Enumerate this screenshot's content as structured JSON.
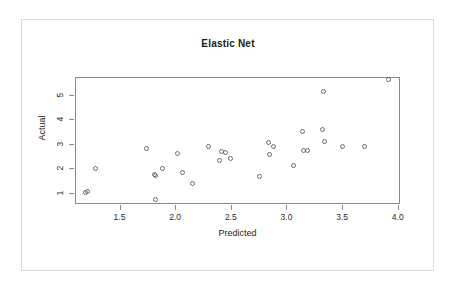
{
  "chart_data": {
    "type": "scatter",
    "title": "Elastic Net",
    "xlabel": "Predicted",
    "ylabel": "Actual",
    "xlim": [
      1.1,
      4.02
    ],
    "ylim": [
      0.55,
      5.72
    ],
    "xticks": [
      "1.5",
      "2.0",
      "2.5",
      "3.0",
      "3.5",
      "4.0"
    ],
    "xtick_values": [
      1.5,
      2.0,
      2.5,
      3.0,
      3.5,
      4.0
    ],
    "yticks": [
      "1",
      "2",
      "3",
      "4",
      "5"
    ],
    "ytick_values": [
      1,
      2,
      3,
      4,
      5
    ],
    "grid": false,
    "legend": "none",
    "marker": "open-circle",
    "marker_color": "#6b6b6b",
    "series": [
      {
        "name": "Predicted vs Actual",
        "points": [
          [
            1.19,
            1.03
          ],
          [
            1.21,
            1.05
          ],
          [
            1.28,
            2.01
          ],
          [
            1.74,
            2.8
          ],
          [
            1.81,
            1.75
          ],
          [
            1.82,
            1.73
          ],
          [
            1.82,
            0.72
          ],
          [
            1.89,
            2.0
          ],
          [
            2.02,
            2.61
          ],
          [
            2.07,
            1.82
          ],
          [
            2.16,
            1.38
          ],
          [
            2.3,
            2.89
          ],
          [
            2.4,
            2.33
          ],
          [
            2.42,
            2.7
          ],
          [
            2.45,
            2.65
          ],
          [
            2.5,
            2.41
          ],
          [
            2.76,
            1.66
          ],
          [
            2.84,
            3.06
          ],
          [
            2.85,
            2.58
          ],
          [
            2.88,
            2.89
          ],
          [
            3.06,
            2.1
          ],
          [
            3.14,
            3.5
          ],
          [
            3.15,
            2.72
          ],
          [
            3.19,
            2.72
          ],
          [
            3.32,
            3.58
          ],
          [
            3.33,
            5.13
          ],
          [
            3.34,
            3.08
          ],
          [
            3.5,
            2.88
          ],
          [
            3.7,
            2.88
          ],
          [
            3.92,
            5.6
          ]
        ]
      }
    ]
  },
  "figure": {
    "title": "Elastic Net",
    "x_axis_label": "Predicted",
    "y_axis_label": "Actual"
  }
}
